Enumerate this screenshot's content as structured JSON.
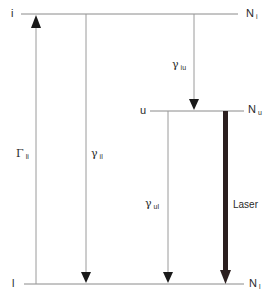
{
  "diagram": {
    "levels": [
      {
        "id": "i",
        "label": "i",
        "population_symbol": "N",
        "population_sub": "i"
      },
      {
        "id": "u",
        "label": "u",
        "population_symbol": "N",
        "population_sub": "u"
      },
      {
        "id": "l",
        "label": "l",
        "population_symbol": "N",
        "population_sub": "l"
      }
    ],
    "transitions": [
      {
        "from": "l",
        "to": "i",
        "symbol": "Γ",
        "sub": "li",
        "style": "thin-arrow-up"
      },
      {
        "from": "i",
        "to": "l",
        "symbol": "γ",
        "sub": "il",
        "style": "thin-arrow-down"
      },
      {
        "from": "i",
        "to": "u",
        "symbol": "γ",
        "sub": "iu",
        "style": "thin-arrow-down"
      },
      {
        "from": "u",
        "to": "l",
        "symbol": "γ",
        "sub": "ul",
        "style": "thin-arrow-down"
      },
      {
        "from": "u",
        "to": "l",
        "label": "Laser",
        "style": "thick-arrow-down"
      }
    ],
    "colors": {
      "line": "#8a8a8a",
      "arrow": "#1a1a1a",
      "laser": "#2b1f1f"
    }
  }
}
